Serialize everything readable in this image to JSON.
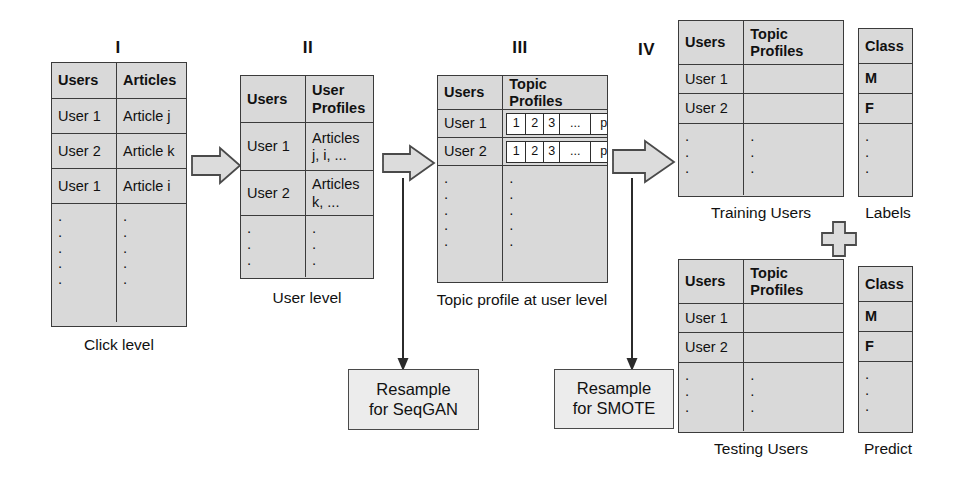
{
  "diagram": {
    "title_stages": [
      "I",
      "II",
      "III",
      "IV"
    ],
    "stage_labels": {
      "one": "I",
      "two": "II",
      "three": "III",
      "four": "IV"
    }
  },
  "table_click": {
    "headers": [
      "Users",
      "Articles"
    ],
    "rows": [
      [
        "User 1",
        "Article j"
      ],
      [
        "User 2",
        "Article k"
      ],
      [
        "User 1",
        "Article i"
      ]
    ],
    "ellipsis": ".",
    "caption": "Click level"
  },
  "table_user": {
    "headers": [
      "Users",
      "User Profiles"
    ],
    "rows": [
      [
        "User 1",
        "Articles j, i, ..."
      ],
      [
        "User 2",
        "Articles k, ..."
      ]
    ],
    "caption": "User level"
  },
  "table_topic": {
    "headers": [
      "Users",
      "Topic Profiles"
    ],
    "rows": [
      {
        "user": "User 1",
        "profile": [
          "1",
          "2",
          "3",
          "...",
          "p"
        ]
      },
      {
        "user": "User 2",
        "profile": [
          "1",
          "2",
          "3",
          "...",
          "p"
        ]
      }
    ],
    "caption": "Topic profile at user level"
  },
  "table_training": {
    "headers": [
      "Users",
      "Topic Profiles"
    ],
    "rows": [
      [
        "User 1",
        ""
      ],
      [
        "User 2",
        ""
      ]
    ],
    "caption": "Training Users"
  },
  "table_training_labels": {
    "header": "Class",
    "rows": [
      "M",
      "F"
    ],
    "caption": "Labels"
  },
  "table_testing": {
    "headers": [
      "Users",
      "Topic Profiles"
    ],
    "rows": [
      [
        "User 1",
        ""
      ],
      [
        "User 2",
        ""
      ]
    ],
    "caption": "Testing Users"
  },
  "table_testing_labels": {
    "header": "Class",
    "rows": [
      "M",
      "F"
    ],
    "caption": "Predict"
  },
  "boxes": {
    "resample_seqgan": "Resample for SeqGAN",
    "resample_seqgan_line1": "Resample",
    "resample_seqgan_line2": "for SeqGAN",
    "resample_smote": "Resample for SMOTE",
    "resample_smote_line1": "Resample",
    "resample_smote_line2": "for SMOTE"
  },
  "symbols": {
    "plus": "+"
  },
  "colors": {
    "table_fill": "#d9d9d9",
    "table_border": "#3b3b3b",
    "box_fill": "#ececec",
    "box_border": "#4a4a4a",
    "arrow_fill": "#dcdcdc",
    "arrow_border": "#4a4a4a",
    "text": "#111111",
    "page_bg": "#ffffff"
  }
}
